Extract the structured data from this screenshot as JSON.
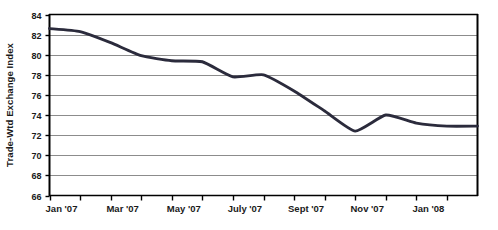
{
  "chart_data": {
    "type": "line",
    "title": "",
    "xlabel": "",
    "ylabel": "Trade-Wtd Exchange Index",
    "ylim": [
      66,
      84
    ],
    "yticks": [
      66,
      68,
      70,
      72,
      74,
      76,
      78,
      80,
      82,
      84
    ],
    "ytick_labels": [
      "66",
      "68",
      "70",
      "72",
      "74",
      "76",
      "78",
      "80",
      "82",
      "84"
    ],
    "grid": true,
    "grid_axis": "y",
    "legend": false,
    "legend_position": "none",
    "line_color": "#2b2b3c",
    "grid_color": "#8c8c8c",
    "axis_color": "#000000",
    "background_color": "#ffffff",
    "xtick_labels": [
      "Jan '07",
      "Mar '07",
      "May '07",
      "July '07",
      "Sept '07",
      "Nov '07",
      "Jan '08"
    ],
    "xtick_label_positions": [
      0,
      2,
      4,
      6,
      8,
      10,
      12
    ],
    "x_minor_tick_positions": [
      0,
      1,
      2,
      3,
      4,
      5,
      6,
      7,
      8,
      9,
      10,
      11,
      12,
      13
    ],
    "x": [
      "Jan '07",
      "Feb '07",
      "Mar '07",
      "Apr '07",
      "May '07",
      "June '07",
      "July '07",
      "Aug '07",
      "Sept '07",
      "Oct '07",
      "Nov '07",
      "Dec '07",
      "Jan '08",
      "Feb '08"
    ],
    "values": [
      82.6,
      82.3,
      81.2,
      79.9,
      79.4,
      79.3,
      77.8,
      78.0,
      76.4,
      74.4,
      72.4,
      74.0,
      73.2,
      72.9
    ],
    "series": [
      {
        "name": "Trade-Wtd Exchange Index",
        "values": [
          82.6,
          82.3,
          81.2,
          79.9,
          79.4,
          79.3,
          77.8,
          78.0,
          76.4,
          74.4,
          72.4,
          74.0,
          73.2,
          72.9
        ]
      }
    ],
    "annotations": []
  }
}
